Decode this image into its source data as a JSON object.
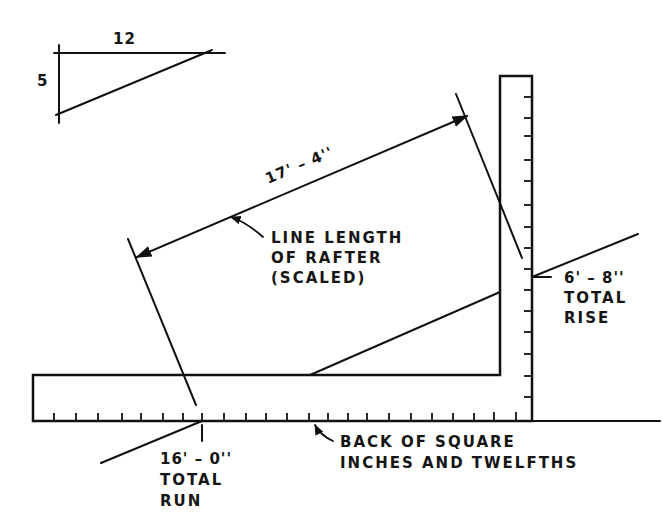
{
  "diagram": {
    "ratio_triangle": {
      "run_label": "12",
      "rise_label": "5"
    },
    "rafter_dimension": {
      "value": "17' – 4''",
      "callout_lines": [
        "LINE LENGTH",
        "OF RAFTER",
        "(SCALED)"
      ]
    },
    "total_rise": {
      "value": "6' – 8''",
      "lines": [
        "TOTAL",
        "RISE"
      ]
    },
    "total_run": {
      "value": "16' – 0''",
      "lines": [
        "TOTAL",
        "RUN"
      ]
    },
    "square_back": {
      "lines": [
        "BACK OF SQUARE",
        "INCHES AND TWELFTHS"
      ]
    },
    "colors": {
      "ink": "#111111",
      "paper": "#ffffff"
    }
  }
}
